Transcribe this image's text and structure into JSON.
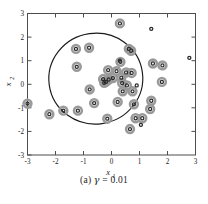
{
  "figure": {
    "caption_prefix": "(a)",
    "caption_symbol": "γ",
    "caption_equals": "=",
    "caption_value": "0.01"
  },
  "axes": {
    "xlabel_base": "x",
    "xlabel_sub": "1",
    "ylabel_base": "x",
    "ylabel_sub": "2",
    "xticks": [
      "-3",
      "-2",
      "-1",
      "0",
      "1",
      "2",
      "3"
    ],
    "yticks": [
      "3",
      "2",
      "1",
      "0",
      "-1",
      "-2",
      "-3"
    ],
    "xlim": [
      -3,
      3
    ],
    "ylim": [
      -3,
      3
    ],
    "frame_color": "#4d4d4d",
    "grid": false
  },
  "chart_data": {
    "type": "scatter",
    "title": "",
    "xlabel": "x_1",
    "ylabel": "x_2",
    "xlim": [
      -3,
      3
    ],
    "ylim": [
      -3,
      3
    ],
    "grid": false,
    "legend": "none",
    "series": [
      {
        "name": "support vectors",
        "marker": "circle-with-halo",
        "point_color": "#2b2b2b",
        "halo_color": "#9a9a9a",
        "points": [
          [
            -3.0,
            -0.82
          ],
          [
            -2.22,
            -1.27
          ],
          [
            -1.72,
            -1.12
          ],
          [
            -1.27,
            1.5
          ],
          [
            -1.24,
            0.74
          ],
          [
            -1.2,
            -1.12
          ],
          [
            -0.8,
            1.55
          ],
          [
            -0.78,
            -0.22
          ],
          [
            -0.62,
            -0.8
          ],
          [
            -0.3,
            0.22
          ],
          [
            -0.26,
            0.06
          ],
          [
            -0.2,
            0.1
          ],
          [
            -0.15,
            -1.46
          ],
          [
            -0.12,
            0.6
          ],
          [
            -0.1,
            0.2
          ],
          [
            0.05,
            0.26
          ],
          [
            0.18,
            0.55
          ],
          [
            0.22,
            -0.75
          ],
          [
            0.3,
            2.58
          ],
          [
            0.32,
            0.95
          ],
          [
            0.35,
            0.28
          ],
          [
            0.38,
            0.05
          ],
          [
            0.4,
            -0.3
          ],
          [
            0.52,
            0.5
          ],
          [
            0.55,
            -0.05
          ],
          [
            0.62,
            1.5
          ],
          [
            0.66,
            -1.9
          ],
          [
            0.7,
            1.42
          ],
          [
            0.72,
            0.48
          ],
          [
            0.75,
            -0.3
          ],
          [
            0.8,
            -0.85
          ],
          [
            0.86,
            -1.44
          ],
          [
            1.1,
            -1.44
          ],
          [
            1.38,
            -1.05
          ],
          [
            1.42,
            -0.7
          ],
          [
            1.48,
            0.88
          ],
          [
            1.8,
            0.1
          ],
          [
            1.82,
            0.8
          ]
        ]
      },
      {
        "name": "non-support vectors",
        "marker": "circle",
        "point_color": "#2b2b2b",
        "points": [
          [
            0.3,
            1.0
          ],
          [
            1.42,
            2.35
          ],
          [
            1.05,
            -1.72
          ],
          [
            2.78,
            1.12
          ],
          [
            0.9,
            -0.05
          ]
        ]
      }
    ],
    "decision_boundary": {
      "shape": "ellipse",
      "label": "decision boundary",
      "color": "#1a1a1a",
      "center": [
        -0.6,
        0.2
      ],
      "rx": 1.68,
      "ry": 1.62,
      "rotation_deg": -8
    }
  }
}
